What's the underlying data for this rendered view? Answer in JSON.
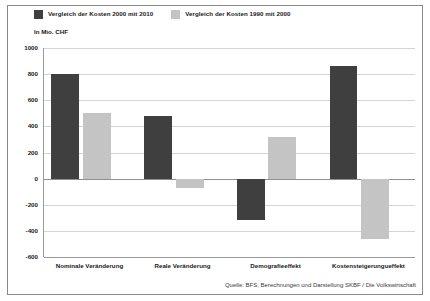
{
  "chart_data": {
    "type": "bar",
    "title": "",
    "subtitle": "",
    "unit_label": "In Mio. CHF",
    "xlabel": "",
    "ylabel": "",
    "ylim": [
      -600,
      1000
    ],
    "yticks": [
      1000,
      800,
      600,
      400,
      200,
      0,
      -200,
      -400,
      -600
    ],
    "ytick_labels": [
      "1000",
      "800",
      "600",
      "400",
      "200",
      "0",
      "-200",
      "-400",
      "-600"
    ],
    "grid": true,
    "legend_position": "top-left",
    "categories": [
      "Nominale Veränderung",
      "Reale Veränderung",
      "Demografieeffekt",
      "Kostensteigerungueffekt"
    ],
    "series": [
      {
        "name": "Vergleich der Kosten 2000 mit 2010",
        "color": "#3f3f3f",
        "values": [
          800,
          480,
          -320,
          860
        ]
      },
      {
        "name": "Vergleich der Kosten 1990 mit 2000",
        "color": "#c4c4c4",
        "values": [
          500,
          -70,
          320,
          -460
        ]
      }
    ],
    "source": "Quelle: BFS; Berechnungen und Darstellung SKBF / Die Volkswirtschaft"
  },
  "legend": {
    "items": [
      {
        "label": "Vergleich der Kosten 2000 mit 2010",
        "color": "#3f3f3f"
      },
      {
        "label": "Vergleich der Kosten 1990 mit 2000",
        "color": "#c4c4c4"
      }
    ]
  },
  "colors": {
    "series_dark": "#3f3f3f",
    "series_light": "#c4c4c4",
    "gridline": "#d4d4d4",
    "axis": "#9a9a9a",
    "frame": "#8a8a8a",
    "text": "#1a1a1a"
  }
}
